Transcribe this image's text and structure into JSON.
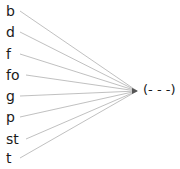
{
  "diagram": {
    "sources": [
      {
        "label": "b",
        "y": 17
      },
      {
        "label": "d",
        "y": 38
      },
      {
        "label": "f",
        "y": 60
      },
      {
        "label": "fo",
        "y": 81
      },
      {
        "label": "g",
        "y": 102
      },
      {
        "label": "p",
        "y": 123
      },
      {
        "label": "st",
        "y": 145
      },
      {
        "label": "t",
        "y": 164
      }
    ],
    "target": {
      "label": "(- - -)",
      "x": 137,
      "y": 91
    },
    "line_color": "#b0b0b0",
    "arrow_color": "#555555"
  }
}
